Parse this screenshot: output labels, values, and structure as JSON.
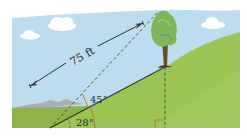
{
  "diagram": {
    "type": "trigonometry-illustration",
    "labels": {
      "distance": "75 ft",
      "angle_top": "45°",
      "angle_bottom": "28°"
    },
    "colors": {
      "sky": "#bcdcef",
      "cloud": "#ffffff",
      "hill_far": "#8fb24a",
      "hill_near": "#9cc455",
      "hill_dark": "#7fa33e",
      "mountains": "#a79fa8",
      "slope_line": "#2f3d16",
      "dashed": "#3e5a2a",
      "arrow": "#333333",
      "angle_arc": "#b07a2a",
      "tree_foliage": "#7fb65a",
      "tree_trunk": "#6b4a2a"
    }
  }
}
